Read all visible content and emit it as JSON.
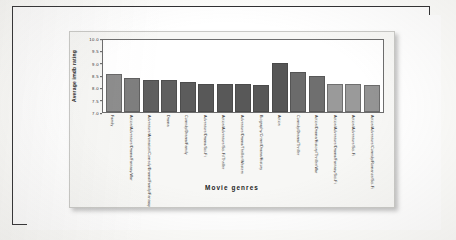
{
  "chart_data": {
    "type": "bar",
    "title": "",
    "xlabel": "Movie genres",
    "ylabel": "Average imdb rating",
    "ylim": [
      7.0,
      10.0
    ],
    "yticks": [
      "10.0",
      "9.5",
      "9.0",
      "8.5",
      "8.0",
      "7.5",
      "7.0"
    ],
    "grid": false,
    "legend": "none",
    "categories": [
      "Family",
      "Action/Adventure/Drama/Fantasy/War",
      "Adventure/Animation/Comedy/Drama/Family/Fantasy",
      "Drama",
      "Comedy/Drama/Family",
      "Adventure/Drama/Sci-Fi",
      "Action/Adventure/Sci-Fi/Thriller",
      "Adventure/Drama/Thriller/Western",
      "Biography/Crime/Drama/History",
      "Action",
      "Comedy/Drama/Thriller",
      "Action/Drama/History/Thriller/War",
      "Action/Adventure/Drama/Fantasy/Sci-Fi",
      "Action/Adventure/Sci-Fi",
      "Action/Adventure/Comedy/Romance/Sci-Fi"
    ],
    "values": [
      8.57,
      8.42,
      8.32,
      8.32,
      8.25,
      8.15,
      8.15,
      8.15,
      8.13,
      9.05,
      8.65,
      8.48,
      8.18,
      8.18,
      8.12
    ],
    "bar_colors": [
      "#8d8d8d",
      "#7e7e7e",
      "#5f5f5f",
      "#5f5f5f",
      "#5c5c5c",
      "#585858",
      "#585858",
      "#585858",
      "#585858",
      "#555555",
      "#6b6b6b",
      "#6f6f6f",
      "#9a9a9a",
      "#9a9a9a",
      "#949494"
    ]
  },
  "watermark": {
    "text": "Data Analysis"
  }
}
